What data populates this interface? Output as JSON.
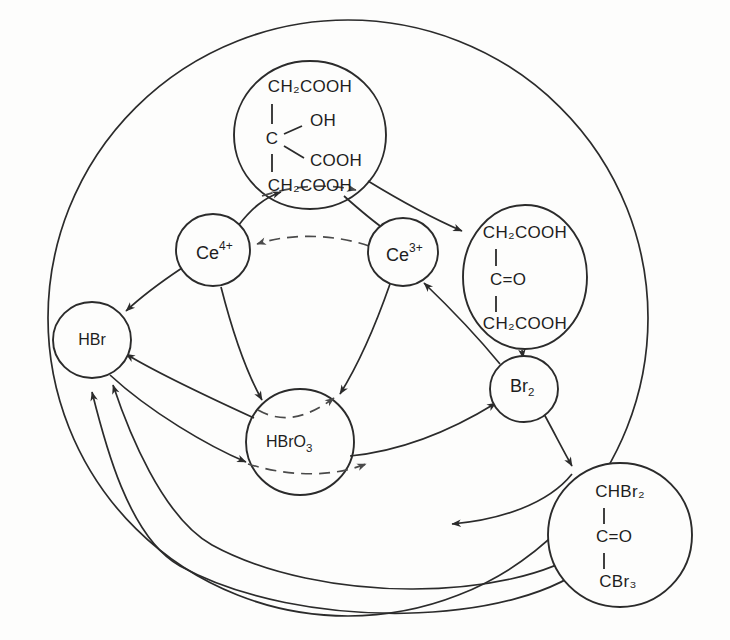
{
  "diagram": {
    "type": "reaction-mechanism-scheme",
    "stroke_color": "#2b2b2b",
    "background_color": "#fdfdfc",
    "dashed_color": "#4a4a4a"
  },
  "nodes": [
    {
      "id": "citric-acid",
      "name": "citric-acid-node",
      "shape": "circle",
      "cx": 310,
      "cy": 135,
      "rx": 76,
      "ry": 74,
      "structure": {
        "top": "CH2COOH",
        "center": "C",
        "branch_upper": "OH",
        "branch_lower": "COOH",
        "bottom": "CH2COOH"
      },
      "lines": [
        "CH₂COOH",
        "C",
        "OH",
        "COOH",
        "CH₂COOH"
      ]
    },
    {
      "id": "ce4",
      "name": "cerium-4-node",
      "shape": "circle",
      "cx": 213,
      "cy": 250,
      "rx": 37,
      "ry": 36,
      "label_base": "Ce",
      "label_sup": "4+"
    },
    {
      "id": "ce3",
      "name": "cerium-3-node",
      "shape": "circle",
      "cx": 403,
      "cy": 252,
      "rx": 35,
      "ry": 34,
      "label_base": "Ce",
      "label_sup": "3+"
    },
    {
      "id": "acetonedicarboxylic",
      "name": "acetonedicarboxylic-acid-node",
      "shape": "circle",
      "cx": 525,
      "cy": 277,
      "rx": 62,
      "ry": 72,
      "structure": {
        "top": "CH2COOH",
        "center": "C=O",
        "bottom": "CH2COOH"
      },
      "lines": [
        "CH₂COOH",
        "C=O",
        "CH₂COOH"
      ]
    },
    {
      "id": "hbr",
      "name": "hydrogen-bromide-node",
      "shape": "circle",
      "cx": 92,
      "cy": 340,
      "rx": 39,
      "ry": 38,
      "label": "HBr"
    },
    {
      "id": "br2",
      "name": "bromine-node",
      "shape": "circle",
      "cx": 524,
      "cy": 389,
      "rx": 34,
      "ry": 33,
      "label_base": "Br",
      "label_sub": "2"
    },
    {
      "id": "hbro3",
      "name": "bromic-acid-node",
      "shape": "circle",
      "cx": 300,
      "cy": 442,
      "rx": 54,
      "ry": 53,
      "label_base": "HBrO",
      "label_sub": "3"
    },
    {
      "id": "bromo-product",
      "name": "bromo-product-node",
      "shape": "circle",
      "cx": 620,
      "cy": 535,
      "rx": 72,
      "ry": 72,
      "structure": {
        "top": "CHBr2",
        "center": "C=O",
        "bottom": "CBr3"
      },
      "lines": [
        "CHBr₂",
        "C=O",
        "CBr₃"
      ]
    }
  ],
  "edges": [
    {
      "id": "ce4-to-citric",
      "name": "edge-ce4-to-citric-acid",
      "style": "solid",
      "from": "ce4",
      "to": "citric-acid"
    },
    {
      "id": "citric-to-ce3",
      "name": "edge-citric-acid-to-ce3",
      "style": "solid",
      "from": "citric-acid",
      "to": "ce3"
    },
    {
      "id": "citric-to-adca",
      "name": "edge-citric-acid-to-acetonedicarboxylic",
      "style": "solid",
      "from": "citric-acid",
      "to": "acetonedicarboxylic"
    },
    {
      "id": "citric-dashed",
      "name": "edge-citric-acid-dashed-base",
      "style": "dashed",
      "from": "citric-acid",
      "to": "citric-acid"
    },
    {
      "id": "ce3-to-ce4",
      "name": "edge-ce3-to-ce4-dashed",
      "style": "dashed",
      "from": "ce3",
      "to": "ce4"
    },
    {
      "id": "ce4-to-hbr",
      "name": "edge-ce4-to-hbr",
      "style": "solid",
      "from": "ce4",
      "to": "hbr"
    },
    {
      "id": "ce4-to-hbro3",
      "name": "edge-ce4-to-hbro3",
      "style": "solid",
      "from": "ce4",
      "to": "hbro3"
    },
    {
      "id": "ce3-to-hbro3",
      "name": "edge-ce3-to-hbro3",
      "style": "solid",
      "from": "ce3",
      "to": "hbro3"
    },
    {
      "id": "br2-to-ce3",
      "name": "edge-br2-to-ce3",
      "style": "solid",
      "from": "br2",
      "to": "ce3"
    },
    {
      "id": "adca-to-br2",
      "name": "edge-acetonedicarboxylic-to-br2",
      "style": "solid",
      "from": "acetonedicarboxylic",
      "to": "br2"
    },
    {
      "id": "hbro3-to-hbr",
      "name": "edge-hbro3-to-hbr",
      "style": "solid",
      "from": "hbro3",
      "to": "hbr"
    },
    {
      "id": "hbr-to-hbro3",
      "name": "edge-hbr-to-hbro3",
      "style": "solid",
      "from": "hbr",
      "to": "hbro3"
    },
    {
      "id": "hbro3-dashed-upper",
      "name": "edge-hbro3-dashed-upper",
      "style": "dashed",
      "from": "hbro3",
      "to": "hbro3"
    },
    {
      "id": "hbro3-dashed-lower",
      "name": "edge-hbro3-dashed-lower",
      "style": "dashed",
      "from": "hbr",
      "to": "hbro3"
    },
    {
      "id": "hbro3-to-br2",
      "name": "edge-hbro3-to-br2",
      "style": "solid",
      "from": "hbro3",
      "to": "br2"
    },
    {
      "id": "br2-to-product",
      "name": "edge-br2-to-bromo-product",
      "style": "solid",
      "from": "br2",
      "to": "bromo-product"
    },
    {
      "id": "product-to-left",
      "name": "edge-bromo-product-return-arrow",
      "style": "solid",
      "from": "bromo-product",
      "to": "hbro3"
    },
    {
      "id": "product-to-hbr-outer",
      "name": "edge-bromo-product-to-hbr-outer",
      "style": "solid",
      "from": "bromo-product",
      "to": "hbr"
    },
    {
      "id": "product-to-hbr-inner",
      "name": "edge-bromo-product-to-hbr-inner",
      "style": "solid",
      "from": "bromo-product",
      "to": "hbr"
    }
  ],
  "boundary": {
    "name": "system-boundary-circle",
    "cx": 348,
    "cy": 318,
    "rx": 300,
    "ry": 298
  }
}
